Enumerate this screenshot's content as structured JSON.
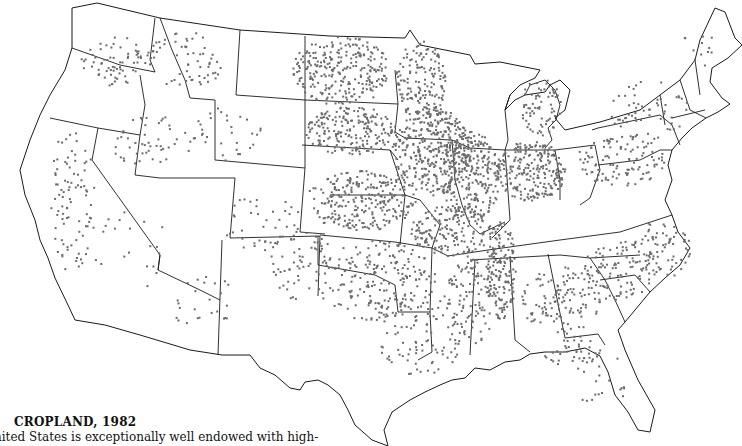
{
  "figure": {
    "title": "CROPLAND, 1982",
    "caption_fragment": "nited States is exceptionally well endowed with high-",
    "map": {
      "type": "dot-density",
      "subject": "Cropland distribution, conterminous United States",
      "year": "1982",
      "dot_color": "#6b6b6b",
      "boundary_color": "#1a1a1a",
      "background_color": "#ffffff"
    }
  }
}
